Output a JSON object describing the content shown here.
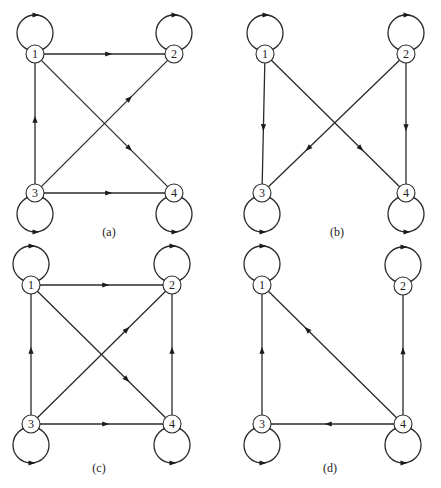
{
  "figure": {
    "panels": [
      {
        "id": "a",
        "caption": "(a)",
        "caption_pos": [
          109,
          236
        ],
        "nodes": [
          {
            "label": "1",
            "x": 35,
            "y": 54,
            "loop": "top"
          },
          {
            "label": "2",
            "x": 174,
            "y": 54,
            "loop": "top"
          },
          {
            "label": "3",
            "x": 35,
            "y": 193,
            "loop": "bottom"
          },
          {
            "label": "4",
            "x": 174,
            "y": 193,
            "loop": "bottom"
          }
        ],
        "edges": [
          {
            "from": "1",
            "to": "2"
          },
          {
            "from": "1",
            "to": "4"
          },
          {
            "from": "3",
            "to": "1"
          },
          {
            "from": "3",
            "to": "2"
          },
          {
            "from": "3",
            "to": "4"
          }
        ]
      },
      {
        "id": "b",
        "caption": "(b)",
        "caption_pos": [
          337,
          236
        ],
        "nodes": [
          {
            "label": "1",
            "x": 265,
            "y": 54,
            "loop": "top"
          },
          {
            "label": "2",
            "x": 406,
            "y": 54,
            "loop": "top"
          },
          {
            "label": "3",
            "x": 262,
            "y": 193,
            "loop": "bottom"
          },
          {
            "label": "4",
            "x": 406,
            "y": 193,
            "loop": "bottom"
          }
        ],
        "edges": [
          {
            "from": "1",
            "to": "3"
          },
          {
            "from": "1",
            "to": "4"
          },
          {
            "from": "2",
            "to": "3"
          },
          {
            "from": "2",
            "to": "4"
          }
        ]
      },
      {
        "id": "c",
        "caption": "(c)",
        "caption_pos": [
          99,
          472
        ],
        "nodes": [
          {
            "label": "1",
            "x": 31,
            "y": 285,
            "loop": "top"
          },
          {
            "label": "2",
            "x": 172,
            "y": 285,
            "loop": "top"
          },
          {
            "label": "3",
            "x": 31,
            "y": 424,
            "loop": "bottom"
          },
          {
            "label": "4",
            "x": 172,
            "y": 424,
            "loop": "bottom"
          }
        ],
        "edges": [
          {
            "from": "1",
            "to": "2"
          },
          {
            "from": "1",
            "to": "4"
          },
          {
            "from": "3",
            "to": "1"
          },
          {
            "from": "3",
            "to": "2"
          },
          {
            "from": "3",
            "to": "4"
          },
          {
            "from": "4",
            "to": "2"
          }
        ]
      },
      {
        "id": "d",
        "caption": "(d)",
        "caption_pos": [
          330,
          472
        ],
        "nodes": [
          {
            "label": "1",
            "x": 262,
            "y": 285,
            "loop": "top"
          },
          {
            "label": "2",
            "x": 403,
            "y": 286,
            "loop": "top"
          },
          {
            "label": "3",
            "x": 262,
            "y": 424,
            "loop": "bottom"
          },
          {
            "label": "4",
            "x": 403,
            "y": 424,
            "loop": "bottom"
          }
        ],
        "edges": [
          {
            "from": "3",
            "to": "1"
          },
          {
            "from": "4",
            "to": "1"
          },
          {
            "from": "4",
            "to": "2"
          },
          {
            "from": "4",
            "to": "3"
          }
        ]
      }
    ],
    "style": {
      "node_radius": 9,
      "loop_radius": 18,
      "stroke_color": "#2a2a2a",
      "background": "#ffffff"
    }
  }
}
